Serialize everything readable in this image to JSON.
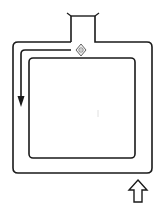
{
  "diagram": {
    "type": "loop-track",
    "colors": {
      "background": "#ffffff",
      "stroke": "#1a1a1a",
      "marker_fill": "#f0f0f0"
    },
    "elements": [
      {
        "id": "outer-track",
        "kind": "rounded-rectangle"
      },
      {
        "id": "inner-island",
        "kind": "rounded-rectangle"
      },
      {
        "id": "entry-neck",
        "kind": "opening",
        "position": "top"
      },
      {
        "id": "junction-marker",
        "kind": "diamond-symbol",
        "position": "top-center"
      },
      {
        "id": "flow-arrow",
        "kind": "arrow",
        "direction": "counter-clockwise (left then down)"
      },
      {
        "id": "entry-arrow",
        "kind": "hollow-arrow",
        "direction": "up",
        "position": "bottom-right"
      }
    ]
  }
}
